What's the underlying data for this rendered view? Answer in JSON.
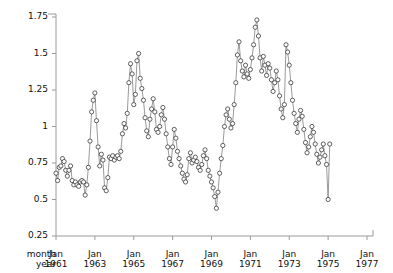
{
  "chart_data": {
    "type": "line",
    "title": "",
    "xlabel": "",
    "ylabel": "",
    "marker": "open-circle",
    "grid": false,
    "legend": null,
    "ylim": [
      0.25,
      1.75
    ],
    "yticks": [
      0.25,
      0.5,
      0.75,
      1,
      1.25,
      1.5,
      1.75
    ],
    "ytick_labels": [
      "0.25",
      "0.5",
      "0.75",
      "1",
      "1.25",
      "1.5",
      "1.75"
    ],
    "xlim_years": [
      1961.0,
      1977.0
    ],
    "xticks_years": [
      1961,
      1963,
      1965,
      1967,
      1969,
      1971,
      1973,
      1975,
      1977
    ],
    "xtick_month_labels": [
      "Jan",
      "Jan",
      "Jan",
      "Jan",
      "Jan",
      "Jan",
      "Jan",
      "Jan",
      "Jan"
    ],
    "xtick_year_labels": [
      "1961",
      "1963",
      "1965",
      "1967",
      "1969",
      "1971",
      "1973",
      "1975",
      "1977"
    ],
    "axis_corner_labels": [
      "month",
      "year"
    ],
    "x_start_year": 1961.0,
    "x_step_years": 0.08333333,
    "series": [
      {
        "name": "series-1",
        "values": [
          0.68,
          0.63,
          0.72,
          0.73,
          0.78,
          0.76,
          0.7,
          0.66,
          0.7,
          0.73,
          0.63,
          0.6,
          0.62,
          0.6,
          0.59,
          0.62,
          0.63,
          0.62,
          0.53,
          0.6,
          0.72,
          0.9,
          1.1,
          1.18,
          1.23,
          1.04,
          0.86,
          0.73,
          0.81,
          0.77,
          0.58,
          0.56,
          0.65,
          0.79,
          0.78,
          0.8,
          0.77,
          0.79,
          0.8,
          0.78,
          0.83,
          0.95,
          1.02,
          0.99,
          1.09,
          1.3,
          1.43,
          1.36,
          1.15,
          1.22,
          1.45,
          1.5,
          1.33,
          1.26,
          1.18,
          1.06,
          0.97,
          0.93,
          1.05,
          1.12,
          1.19,
          1.1,
          0.98,
          0.96,
          1.0,
          1.08,
          1.13,
          1.05,
          0.95,
          0.86,
          0.78,
          0.74,
          0.86,
          0.98,
          0.92,
          0.83,
          0.78,
          0.73,
          0.68,
          0.64,
          0.62,
          0.67,
          0.78,
          0.82,
          0.75,
          0.77,
          0.79,
          0.76,
          0.72,
          0.7,
          0.74,
          0.8,
          0.84,
          0.78,
          0.7,
          0.66,
          0.62,
          0.58,
          0.52,
          0.44,
          0.55,
          0.68,
          0.78,
          0.87,
          1.0,
          1.08,
          1.12,
          1.05,
          0.99,
          1.02,
          1.15,
          1.3,
          1.49,
          1.58,
          1.45,
          1.38,
          1.34,
          1.42,
          1.36,
          1.33,
          1.39,
          1.47,
          1.56,
          1.68,
          1.73,
          1.62,
          1.47,
          1.38,
          1.48,
          1.42,
          1.35,
          1.43,
          1.4,
          1.32,
          1.24,
          1.3,
          1.38,
          1.32,
          1.21,
          1.12,
          1.06,
          1.15,
          1.56,
          1.51,
          1.42,
          1.3,
          1.18,
          1.09,
          1.02,
          0.96,
          1.05,
          1.11,
          1.07,
          0.98,
          0.89,
          0.82,
          0.86,
          0.93,
          1.0,
          0.96,
          0.88,
          0.81,
          0.75,
          0.79,
          0.84,
          0.88,
          0.8,
          0.74,
          0.5,
          0.88
        ]
      }
    ]
  }
}
